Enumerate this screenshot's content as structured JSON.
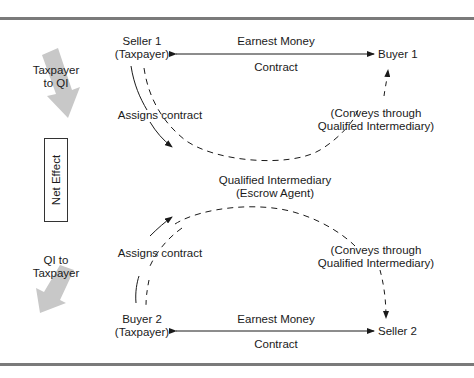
{
  "diagram": {
    "top": {
      "seller1": {
        "line1": "Seller 1",
        "line2": "(Taxpayer)"
      },
      "buyer1": "Buyer 1",
      "earnest_money": "Earnest Money",
      "contract": "Contract",
      "assigns_contract": "Assigns contract",
      "conveys": {
        "line1": "(Conveys through",
        "line2": "Qualified Intermediary)"
      }
    },
    "middle": {
      "qi": {
        "line1": "Qualified Intermediary",
        "line2": "(Escrow Agent)"
      },
      "net_effect": "Net Effect"
    },
    "bottom": {
      "buyer2": {
        "line1": "Buyer 2",
        "line2": "(Taxpayer)"
      },
      "seller2": "Seller 2",
      "earnest_money": "Earnest Money",
      "contract": "Contract",
      "assigns_contract": "Assigns contract",
      "conveys": {
        "line1": "(Conveys through",
        "line2": "Qualified Intermediary)"
      }
    },
    "side": {
      "taxpayer_to_qi": {
        "line1": "Taxpayer",
        "line2": "to QI"
      },
      "qi_to_taxpayer": {
        "line1": "QI to",
        "line2": "Taxpayer"
      }
    },
    "colors": {
      "rule": "#7a7a7a",
      "big_arrow": "#c8c8c8",
      "line": "#1a1a1a"
    }
  }
}
